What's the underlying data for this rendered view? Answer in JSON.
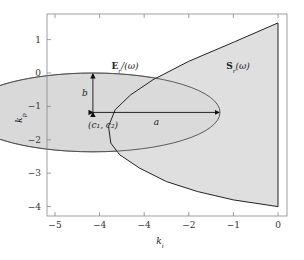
{
  "chart_data": {
    "type": "area",
    "title": "",
    "xlabel": "k_i",
    "ylabel": "k_p",
    "xlim": [
      -5.2,
      0.2
    ],
    "ylim": [
      -4.2,
      1.8
    ],
    "xticks": [
      -5,
      -4,
      -3,
      -2,
      -1,
      0
    ],
    "xtick_labels": [
      "−5",
      "−4",
      "−4",
      "−2",
      "−1",
      "0"
    ],
    "yticks": [
      1,
      0,
      -1,
      -2,
      -3,
      -4
    ],
    "ytick_labels": [
      "1",
      "0",
      "−1",
      "−2",
      "−3",
      "−4"
    ],
    "grid": false,
    "ellipse": {
      "name": "E_r(ω)",
      "label_main": "E",
      "label_sub": "r",
      "label_arg": "/(ω)",
      "center": [
        -4.15,
        -1.18
      ],
      "a": 2.85,
      "b": 1.18,
      "fill": "#d9d9d9",
      "center_label": "(c₁, c₂)",
      "a_label": "a",
      "b_label": "b"
    },
    "region": {
      "name": "S_r(ω)",
      "label_main": "S",
      "label_sub": "r",
      "label_arg": "(ω)",
      "fill": "#d9d9d9",
      "upper_boundary": [
        [
          0,
          1.5
        ],
        [
          -1,
          0.92
        ],
        [
          -2,
          0.35
        ],
        [
          -2.8,
          -0.2
        ],
        [
          -3.3,
          -0.65
        ],
        [
          -3.65,
          -1.1
        ],
        [
          -3.8,
          -1.6
        ],
        [
          -3.75,
          -2.1
        ],
        [
          -3.55,
          -2.45
        ]
      ],
      "lower_boundary": [
        [
          -3.55,
          -2.45
        ],
        [
          -3.1,
          -2.85
        ],
        [
          -2.5,
          -3.25
        ],
        [
          -1.8,
          -3.55
        ],
        [
          -1,
          -3.8
        ],
        [
          0,
          -4.0
        ]
      ]
    },
    "legend": "none"
  }
}
